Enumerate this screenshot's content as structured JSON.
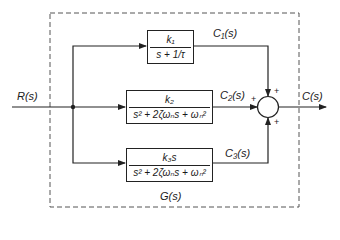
{
  "diagram": {
    "input_label": "R(s)",
    "output_label": "C(s)",
    "system_label": "G(s)",
    "blocks": [
      {
        "id": "block-1",
        "numerator": "k₁",
        "denominator": "s + 1/τ",
        "output_label": "C₁(s)"
      },
      {
        "id": "block-2",
        "numerator": "k₂",
        "denominator": "s² + 2ζωₙs + ωₙ²",
        "output_label": "C₂(s)"
      },
      {
        "id": "block-3",
        "numerator": "k₃s",
        "denominator": "s² + 2ζωₙs + ωₙ²",
        "output_label": "C₃(s)"
      }
    ],
    "summing_junction": {
      "signs": {
        "top": "+",
        "left": "+",
        "bottom": "+"
      }
    }
  }
}
